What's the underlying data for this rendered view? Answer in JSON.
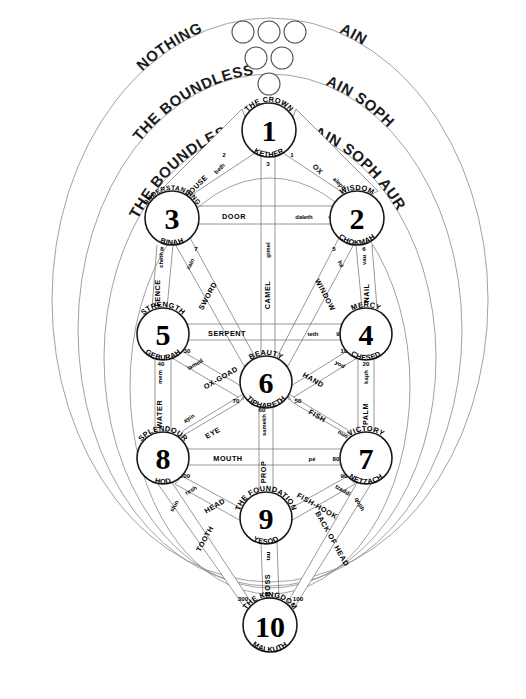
{
  "diagram": {
    "background": "#ffffff",
    "line_color": "#6b6b6b",
    "veil_color": "#8a8a8a",
    "text_color": "#000000"
  },
  "veils": {
    "left_labels": [
      "NOTHING",
      "THE BOUNDLESS",
      "THE BOUNDLESS LIGHT"
    ],
    "right_labels": [
      "AIN",
      "AIN SOPH",
      "AIN SOPH AUR"
    ],
    "circle_rows": [
      3,
      2,
      1
    ]
  },
  "sephiroth": [
    {
      "num": "1",
      "title": "THE CROWN",
      "name": "KETHER",
      "cx": 269,
      "cy": 130,
      "r": 27
    },
    {
      "num": "2",
      "title": "WISDOM",
      "name": "CHOKMAH",
      "cx": 357,
      "cy": 218,
      "r": 27
    },
    {
      "num": "3",
      "title": "UNDERSTANDING",
      "name": "BINAH",
      "cx": 172,
      "cy": 218,
      "r": 27
    },
    {
      "num": "4",
      "title": "MERCY",
      "name": "CHESED",
      "cx": 366,
      "cy": 334,
      "r": 26
    },
    {
      "num": "5",
      "title": "STRENGTH",
      "name": "GEBURAH",
      "cx": 163,
      "cy": 334,
      "r": 26
    },
    {
      "num": "6",
      "title": "BEAUTY",
      "name": "TIPHARETH",
      "cx": 266,
      "cy": 382,
      "r": 26
    },
    {
      "num": "7",
      "title": "VICTORY",
      "name": "NETZACH",
      "cx": 366,
      "cy": 458,
      "r": 26
    },
    {
      "num": "8",
      "title": "SPLENDOUR",
      "name": "HOD",
      "cx": 163,
      "cy": 458,
      "r": 26
    },
    {
      "num": "9",
      "title": "THE FOUNDATION",
      "name": "YESOD",
      "cx": 266,
      "cy": 518,
      "r": 26
    },
    {
      "num": "10",
      "title": "THE KINGDOM",
      "name": "MALKUTH",
      "cx": 270,
      "cy": 625,
      "r": 27
    }
  ],
  "paths": [
    {
      "id": "aleph",
      "num": "1",
      "letter": "aleph",
      "name": "OX",
      "from": "1",
      "to": "2"
    },
    {
      "id": "beth",
      "num": "2",
      "letter": "beth",
      "name": "HOUSE",
      "from": "1",
      "to": "3"
    },
    {
      "id": "gimel",
      "num": "3",
      "letter": "gimel",
      "name": "CAMEL",
      "from": "1",
      "to": "6"
    },
    {
      "id": "daleth",
      "num": "4",
      "letter": "daleth",
      "name": "DOOR",
      "from": "3",
      "to": "2"
    },
    {
      "id": "he",
      "num": "5",
      "letter": "hé",
      "name": "WINDOW",
      "from": "2",
      "to": "6"
    },
    {
      "id": "vau",
      "num": "6",
      "letter": "vau",
      "name": "NAIL",
      "from": "2",
      "to": "4"
    },
    {
      "id": "zain",
      "num": "7",
      "letter": "zain",
      "name": "SWORD",
      "from": "3",
      "to": "6"
    },
    {
      "id": "cheth",
      "num": "8",
      "letter": "cheth",
      "name": "FENCE",
      "from": "3",
      "to": "5"
    },
    {
      "id": "teth",
      "num": "9",
      "letter": "teth",
      "name": "SERPENT",
      "from": "5",
      "to": "4"
    },
    {
      "id": "yod",
      "num": "10",
      "letter": "yod",
      "name": "HAND",
      "from": "4",
      "to": "6"
    },
    {
      "id": "kaph",
      "num": "20",
      "letter": "kaph",
      "name": "PALM",
      "from": "4",
      "to": "7"
    },
    {
      "id": "lamed",
      "num": "30",
      "letter": "lamed",
      "name": "OX-GOAD",
      "from": "5",
      "to": "6"
    },
    {
      "id": "mem",
      "num": "40",
      "letter": "mem",
      "name": "WATER",
      "from": "5",
      "to": "8"
    },
    {
      "id": "nun",
      "num": "50",
      "letter": "nun",
      "name": "FISH",
      "from": "6",
      "to": "7"
    },
    {
      "id": "samekh",
      "num": "60",
      "letter": "samekh",
      "name": "PROP",
      "from": "6",
      "to": "9"
    },
    {
      "id": "ayin",
      "num": "70",
      "letter": "ayin",
      "name": "EYE",
      "from": "6",
      "to": "8"
    },
    {
      "id": "pe",
      "num": "80",
      "letter": "pé",
      "name": "MOUTH",
      "from": "8",
      "to": "7"
    },
    {
      "id": "tzaddi",
      "num": "90",
      "letter": "tzaddi",
      "name": "FISH-HOOK",
      "from": "7",
      "to": "9"
    },
    {
      "id": "qoph",
      "num": "100",
      "letter": "qoph",
      "name": "BACK OF HEAD",
      "from": "7",
      "to": "10"
    },
    {
      "id": "resh",
      "num": "200",
      "letter": "resh",
      "name": "HEAD",
      "from": "8",
      "to": "9"
    },
    {
      "id": "shin",
      "num": "300",
      "letter": "shin",
      "name": "TOOTH",
      "from": "8",
      "to": "10"
    },
    {
      "id": "tau",
      "num": "400",
      "letter": "tau",
      "name": "CROSS",
      "from": "9",
      "to": "10"
    }
  ]
}
